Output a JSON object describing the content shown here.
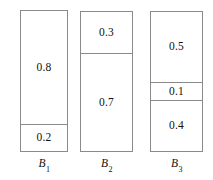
{
  "chart_data": {
    "type": "bar",
    "title": "",
    "subtitle": "",
    "xlabel": "",
    "ylabel": "",
    "grid": false,
    "legend": "none",
    "orientation": "vertical",
    "stacked": true,
    "ylim": [
      0,
      1
    ],
    "categories": [
      "B 1",
      "B 2",
      "B 3"
    ],
    "bars": [
      {
        "name": "B 1",
        "label_base": "B",
        "label_sub": "1",
        "segments": [
          {
            "value": 0.8,
            "label": "0.8"
          },
          {
            "value": 0.2,
            "label": "0.2"
          }
        ]
      },
      {
        "name": "B 2",
        "label_base": "B",
        "label_sub": "2",
        "segments": [
          {
            "value": 0.3,
            "label": "0.3"
          },
          {
            "value": 0.7,
            "label": "0.7"
          }
        ]
      },
      {
        "name": "B 3",
        "label_base": "B",
        "label_sub": "3",
        "segments": [
          {
            "value": 0.5,
            "label": "0.5"
          },
          {
            "value": 0.1,
            "label": "0.1"
          },
          {
            "value": 0.4,
            "label": "0.4"
          }
        ]
      }
    ],
    "colors": {
      "outline": "#8a8a8a",
      "fill": "#ffffff",
      "text": "#111111",
      "background": "#ffffff"
    }
  }
}
